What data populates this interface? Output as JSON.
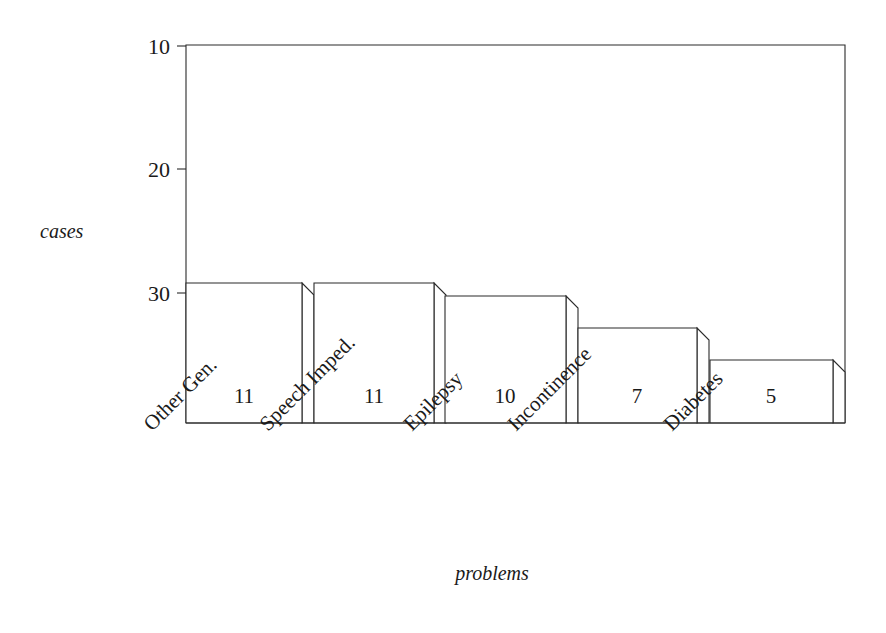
{
  "chart_data": {
    "type": "bar",
    "title": "",
    "subtitle": "",
    "xlabel": "problems",
    "ylabel": "cases",
    "categories": [
      "Other Gen.",
      "Speech Imped.",
      "Epilepsy",
      "Incontinence",
      "Diabetes"
    ],
    "values": [
      11,
      11,
      10,
      7,
      5
    ],
    "value_labels": [
      "11",
      "11",
      "10",
      "7",
      "5"
    ],
    "ylim": [
      0,
      30
    ],
    "yticks": [
      10,
      20,
      30
    ],
    "ytick_labels": [
      "10",
      "20",
      "30"
    ],
    "xticks_rotation_deg": -45,
    "grid": false,
    "legend": null,
    "legend_position": "none",
    "style": {
      "line_color": "#2b2b2b",
      "bar_fill": "#ffffff",
      "text_color": "#1a1a1a",
      "background": "#ffffff",
      "bar_style": "outlined-3d-step",
      "side_face_depth_px": 12
    },
    "geometry": {
      "plot_left_px": 186,
      "plot_right_px": 845,
      "plot_top_px": 45,
      "baseline_px": 423,
      "y_value_30_px": 46,
      "y_value_20_px": 169,
      "y_value_10_px": 293,
      "bars": [
        {
          "category": "Other Gen.",
          "value": 11,
          "left_px": 186,
          "right_px": 302,
          "top_px": 283
        },
        {
          "category": "Speech Imped.",
          "value": 11,
          "left_px": 314,
          "right_px": 434,
          "top_px": 283
        },
        {
          "category": "Epilepsy",
          "value": 10,
          "left_px": 445,
          "right_px": 566,
          "top_px": 296
        },
        {
          "category": "Incontinence",
          "value": 7,
          "left_px": 578,
          "right_px": 697,
          "top_px": 328
        },
        {
          "category": "Diabetes",
          "value": 5,
          "left_px": 710,
          "right_px": 833,
          "top_px": 360
        }
      ],
      "category_label_anchors": [
        {
          "x": 152,
          "y": 432
        },
        {
          "x": 268,
          "y": 432
        },
        {
          "x": 412,
          "y": 432
        },
        {
          "x": 516,
          "y": 432
        },
        {
          "x": 672,
          "y": 432
        }
      ],
      "value_label_positions": [
        {
          "x": 244,
          "y": 403
        },
        {
          "x": 374,
          "y": 403
        },
        {
          "x": 505,
          "y": 403
        },
        {
          "x": 637,
          "y": 403
        },
        {
          "x": 771,
          "y": 403
        }
      ],
      "ytick_label_positions": [
        {
          "value": 30,
          "x": 170,
          "y": 54
        },
        {
          "value": 20,
          "x": 170,
          "y": 177
        },
        {
          "value": 10,
          "x": 170,
          "y": 301
        }
      ],
      "ylabel_position": {
        "x": 40,
        "y": 238
      },
      "xlabel_position": {
        "x": 492,
        "y": 580
      }
    }
  }
}
